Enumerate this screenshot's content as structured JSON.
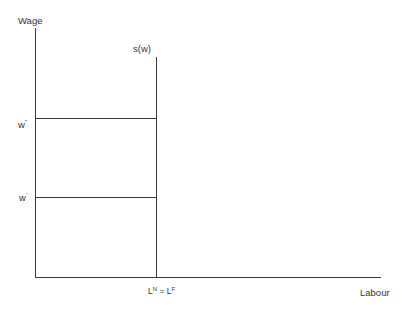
{
  "diagram": {
    "type": "labour-supply-diagram",
    "y_axis_label": "Wage",
    "x_axis_label": "Labour",
    "curve_label": "s(w)",
    "wage_levels": [
      {
        "label_base": "w",
        "label_mark": "''",
        "label": "w''",
        "y": 118
      },
      {
        "label_base": "w",
        "label_mark": "'",
        "label": "w'",
        "y": 197
      }
    ],
    "x_marker": {
      "left_base": "L",
      "left_sup": "N",
      "equals": " = ",
      "right_base": "L",
      "right_sup": "F",
      "label": "L^N = L^F"
    },
    "colors": {
      "line": "#3a3a3a",
      "text": "#333333",
      "background": "#ffffff"
    }
  }
}
